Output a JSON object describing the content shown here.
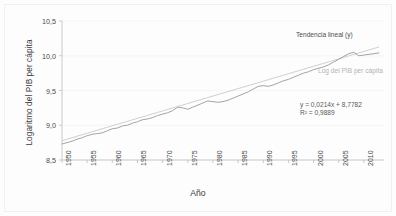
{
  "axes": {
    "y_title": "Logaritmo del PIB per cápita",
    "x_title": "Año",
    "y_ticks": [
      "10,5",
      "10,0",
      "9,5",
      "9,0",
      "8,5"
    ],
    "x_ticks": [
      "1950",
      "1955",
      "1960",
      "1965",
      "1970",
      "1975",
      "1980",
      "1985",
      "1990",
      "1995",
      "2000",
      "2005",
      "2010"
    ]
  },
  "annotations": {
    "trend_label": "Tendencia lineal (y)",
    "series_label": "Log del PIB per cápita",
    "equation": "y = 0,0214x + 8,7782",
    "r_squared": "R² = 0,9889"
  },
  "colors": {
    "series_line": "#9a9a9a",
    "trend_line": "#c9c9c9",
    "axis": "#bdbdbd",
    "grid": "#f2f2f2",
    "text": "#3b3b3b"
  },
  "chart_data": {
    "type": "line",
    "title": "",
    "xlabel": "Año",
    "ylabel": "Logaritmo del PIB per cápita",
    "xlim": [
      1950,
      2014
    ],
    "ylim": [
      8.5,
      10.5
    ],
    "grid": true,
    "legend": "inline-annotations",
    "x": [
      1950,
      1951,
      1952,
      1953,
      1954,
      1955,
      1956,
      1957,
      1958,
      1959,
      1960,
      1961,
      1962,
      1963,
      1964,
      1965,
      1966,
      1967,
      1968,
      1969,
      1970,
      1971,
      1972,
      1973,
      1974,
      1975,
      1976,
      1977,
      1978,
      1979,
      1980,
      1981,
      1982,
      1983,
      1984,
      1985,
      1986,
      1987,
      1988,
      1989,
      1990,
      1991,
      1992,
      1993,
      1994,
      1995,
      1996,
      1997,
      1998,
      1999,
      2000,
      2001,
      2002,
      2003,
      2004,
      2005,
      2006,
      2007,
      2008,
      2009,
      2010,
      2011,
      2012,
      2013
    ],
    "series": [
      {
        "name": "Log del PIB per cápita",
        "color": "#9a9a9a",
        "values": [
          8.73,
          8.75,
          8.77,
          8.8,
          8.82,
          8.85,
          8.87,
          8.88,
          8.89,
          8.92,
          8.95,
          8.96,
          8.99,
          9.0,
          9.03,
          9.05,
          9.08,
          9.09,
          9.11,
          9.14,
          9.16,
          9.18,
          9.21,
          9.26,
          9.25,
          9.23,
          9.26,
          9.29,
          9.32,
          9.35,
          9.34,
          9.33,
          9.34,
          9.36,
          9.39,
          9.42,
          9.45,
          9.48,
          9.52,
          9.56,
          9.57,
          9.56,
          9.58,
          9.61,
          9.64,
          9.66,
          9.69,
          9.72,
          9.75,
          9.77,
          9.8,
          9.82,
          9.84,
          9.87,
          9.91,
          9.95,
          9.99,
          10.03,
          10.05,
          10.0,
          10.01,
          10.02,
          10.03,
          10.04
        ]
      },
      {
        "name": "Tendencia lineal (y)",
        "color": "#c9c9c9",
        "equation": "y = 0,0214x + 8,7782",
        "r_squared": 0.9889,
        "slope": 0.0214,
        "intercept": 8.7782,
        "values": [
          8.7782,
          8.7996,
          8.821,
          8.8424,
          8.8638,
          8.8852,
          8.9066,
          8.928,
          8.9494,
          8.9708,
          8.9922,
          9.0136,
          9.035,
          9.0564,
          9.0778,
          9.0992,
          9.1206,
          9.142,
          9.1634,
          9.1848,
          9.2062,
          9.2276,
          9.249,
          9.2704,
          9.2918,
          9.3132,
          9.3346,
          9.356,
          9.3774,
          9.3988,
          9.4202,
          9.4416,
          9.463,
          9.4844,
          9.5058,
          9.5272,
          9.5486,
          9.57,
          9.5914,
          9.6128,
          9.6342,
          9.6556,
          9.677,
          9.6984,
          9.7198,
          9.7412,
          9.7626,
          9.784,
          9.8054,
          9.8268,
          9.8482,
          9.8696,
          9.891,
          9.9124,
          9.9338,
          9.9552,
          9.9766,
          9.998,
          10.0194,
          10.0408,
          10.0622,
          10.0836,
          10.105,
          10.1264
        ]
      }
    ]
  }
}
